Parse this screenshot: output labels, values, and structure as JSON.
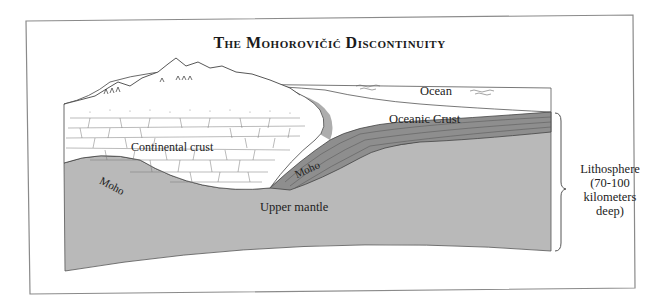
{
  "figure": {
    "title": "The Mohorovičić Discontinuity"
  },
  "labels": {
    "ocean": "Ocean",
    "oceanic_crust": "Oceanic Crust",
    "continental_crust": "Continental crust",
    "moho_left": "Moho",
    "moho_right": "Moho",
    "upper_mantle": "Upper mantle"
  },
  "lithosphere": {
    "line1": "Lithosphere",
    "line2": "(70-100",
    "line3": "kilometers",
    "line4": "deep)"
  },
  "colors": {
    "frame": "#8a8a8a",
    "mantle": "#b9b9b9",
    "oceanic_crust": "#8e8e8e",
    "continental_crust": "#ffffff",
    "outline": "#4a4a4a"
  }
}
